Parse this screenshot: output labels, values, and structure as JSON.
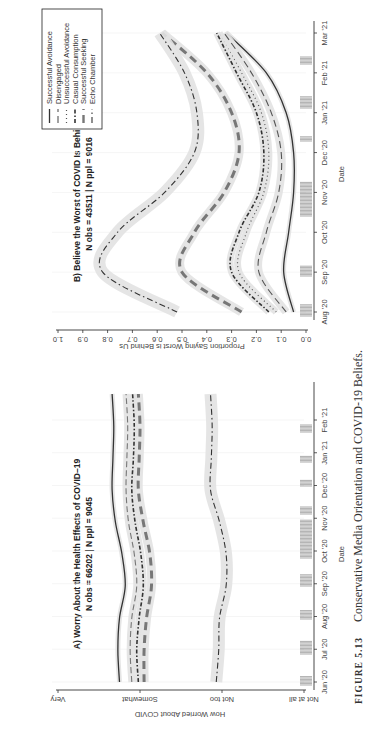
{
  "figure": {
    "caption_label": "FIGURE 5.13",
    "caption_text": "Conservative Media Orientation and COVID-19 Beliefs."
  },
  "chart_data": [
    {
      "type": "line",
      "panel": "A",
      "title": "A) Worry About the Health Effects of COVID–19",
      "subtitle": "N obs = 66202 | N ppl = 9045",
      "xlabel": "Date",
      "ylabel": "How Worried About COVID",
      "x_ticks": [
        "Jun '20",
        "Jul '20",
        "Aug '20",
        "Sep '20",
        "Oct '20",
        "Nov '20",
        "Dec '20",
        "Jan '21",
        "Feb '21"
      ],
      "y_ticks": [
        "Not at all",
        "Not too",
        "Somewhat",
        "Very"
      ],
      "y_tick_values": [
        1,
        2,
        3,
        4
      ],
      "ylim": [
        1,
        4
      ],
      "grid": true,
      "x": [
        "Jun '20",
        "Jul '20",
        "Aug '20",
        "Sep '20",
        "Oct '20",
        "Nov '20",
        "Dec '20",
        "Jan '21",
        "Feb '21",
        "Mar '21"
      ],
      "series": [
        {
          "name": "Successful Avoidance",
          "style": "solid",
          "values": [
            3.25,
            3.27,
            3.25,
            3.18,
            3.22,
            3.3,
            3.34,
            3.33,
            3.32,
            3.34
          ]
        },
        {
          "name": "Disengaged",
          "style": "longdash-light",
          "values": [
            3.1,
            3.12,
            3.1,
            3.04,
            3.07,
            3.14,
            3.17,
            3.16,
            3.15,
            3.17
          ]
        },
        {
          "name": "Casual Consumption",
          "style": "dashdot-heavy",
          "values": [
            3.02,
            3.04,
            3.01,
            2.96,
            2.99,
            3.06,
            3.1,
            3.08,
            3.07,
            3.09
          ]
        },
        {
          "name": "Successful Seeking",
          "style": "thick-dash",
          "values": [
            2.95,
            2.95,
            2.92,
            2.86,
            2.88,
            2.96,
            3.02,
            3.01,
            3.0,
            3.02
          ]
        },
        {
          "name": "Echo Chamber",
          "style": "dashdot",
          "values": [
            2.07,
            2.04,
            2.03,
            1.95,
            1.95,
            2.03,
            2.14,
            2.13,
            2.12,
            2.14
          ]
        }
      ],
      "legend_position": "none",
      "rug": "date density bars along x-axis"
    },
    {
      "type": "line",
      "panel": "B",
      "title": "B) Believe the Worst of COVID Is Behind Us",
      "subtitle": "N obs = 43511 | N ppl = 9016",
      "xlabel": "Date",
      "ylabel": "Proportion Saying Worst is Behind Us",
      "x_ticks": [
        "Aug '20",
        "Sep '20",
        "Oct '20",
        "Nov '20",
        "Dec '20",
        "Jan '21",
        "Feb '21",
        "Mar '21"
      ],
      "y_ticks": [
        "0.0",
        "0.1",
        "0.2",
        "0.3",
        "0.4",
        "0.5",
        "0.6",
        "0.7",
        "0.8",
        "0.9",
        "1.0"
      ],
      "ylim": [
        0,
        1
      ],
      "grid": true,
      "x": [
        "Aug '20",
        "Sep '20",
        "Oct '20",
        "Nov '20",
        "Dec '20",
        "Jan '21",
        "Feb '21",
        "Mar '21"
      ],
      "series": [
        {
          "name": "Successful Avoidance",
          "style": "solid",
          "values": [
            0.05,
            0.09,
            0.07,
            0.05,
            0.05,
            0.08,
            0.16,
            0.32
          ]
        },
        {
          "name": "Disengaged",
          "style": "longdash",
          "values": [
            0.08,
            0.19,
            0.16,
            0.11,
            0.1,
            0.14,
            0.22,
            0.33
          ]
        },
        {
          "name": "Unsuccessful Avoidance",
          "style": "dotted",
          "values": [
            0.12,
            0.27,
            0.24,
            0.17,
            0.15,
            0.18,
            0.26,
            0.35
          ]
        },
        {
          "name": "Casual Consumption",
          "style": "dashdot-heavy",
          "values": [
            0.15,
            0.3,
            0.27,
            0.19,
            0.17,
            0.2,
            0.28,
            0.36
          ]
        },
        {
          "name": "Successful Seeking",
          "style": "thick-dash",
          "values": [
            0.26,
            0.5,
            0.45,
            0.33,
            0.27,
            0.3,
            0.4,
            0.58
          ]
        },
        {
          "name": "Echo Chamber",
          "style": "dashdot",
          "values": [
            0.52,
            0.82,
            0.76,
            0.57,
            0.45,
            0.44,
            0.49,
            0.59
          ]
        }
      ],
      "legend_position": "top-left",
      "rug": "date density bars along x-axis"
    }
  ],
  "legend": {
    "items": [
      {
        "label": "Successful Avoidance"
      },
      {
        "label": "Disengaged"
      },
      {
        "label": "Unsuccessful Avoidance"
      },
      {
        "label": "Casual Consumption"
      },
      {
        "label": "Successful Seeking"
      },
      {
        "label": "Echo Chamber"
      }
    ]
  },
  "colors": {
    "line": "#555555",
    "line_dark": "#333333",
    "ribbon": "#e2e2e2",
    "rug": "#8a8a8a",
    "axis": "#333333"
  }
}
